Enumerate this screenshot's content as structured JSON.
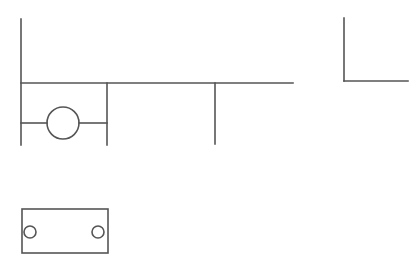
{
  "diagram": {
    "title": "",
    "width": 417,
    "height": 273,
    "background": "#ffffff",
    "stroke_color": "#555555",
    "elements": {
      "left_rail": {
        "x1": 21,
        "y1": 19,
        "x2": 21,
        "y2": 145
      },
      "top_bus": {
        "x1": 21,
        "y1": 83,
        "x2": 293,
        "y2": 83
      },
      "branch_mid": {
        "x1": 107,
        "y1": 83,
        "x2": 107,
        "y2": 145
      },
      "branch_right": {
        "x1": 215,
        "y1": 83,
        "x2": 215,
        "y2": 144
      },
      "rung_left_wire": {
        "x1": 21,
        "y1": 123,
        "x2": 47,
        "y2": 123
      },
      "rung_right_wire": {
        "x1": 79,
        "y1": 123,
        "x2": 107,
        "y2": 123
      },
      "coil_circle": {
        "cx": 63,
        "cy": 123,
        "r": 16
      },
      "corner_vertical": {
        "x1": 344,
        "y1": 18,
        "x2": 344,
        "y2": 81
      },
      "corner_horizontal": {
        "x1": 344,
        "y1": 81,
        "x2": 408,
        "y2": 81
      },
      "plate_rect": {
        "x": 22,
        "y": 209,
        "width": 86,
        "height": 44
      },
      "plate_hole_left": {
        "cx": 30,
        "cy": 232,
        "r": 6
      },
      "plate_hole_right": {
        "cx": 98,
        "cy": 232,
        "r": 6
      }
    }
  }
}
